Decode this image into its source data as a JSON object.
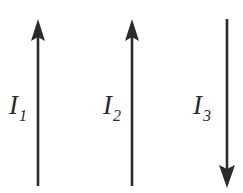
{
  "figure": {
    "width": 243,
    "height": 193,
    "background_color": "#ffffff",
    "stroke_color": "#2b2b2b"
  },
  "wires": [
    {
      "id": "wire-1",
      "label_symbol": "I",
      "label_subscript": "1",
      "direction": "up",
      "x": 38,
      "y_top": 20,
      "y_bottom": 186,
      "arrowhead_at": "top",
      "label_x": 9,
      "label_y": 92
    },
    {
      "id": "wire-2",
      "label_symbol": "I",
      "label_subscript": "2",
      "direction": "up",
      "x": 132,
      "y_top": 20,
      "y_bottom": 186,
      "arrowhead_at": "top",
      "label_x": 103,
      "label_y": 92
    },
    {
      "id": "wire-3",
      "label_symbol": "I",
      "label_subscript": "3",
      "direction": "down",
      "x": 227,
      "y_top": 19,
      "y_bottom": 188,
      "arrowhead_at": "bottom",
      "label_x": 193,
      "label_y": 92
    }
  ]
}
